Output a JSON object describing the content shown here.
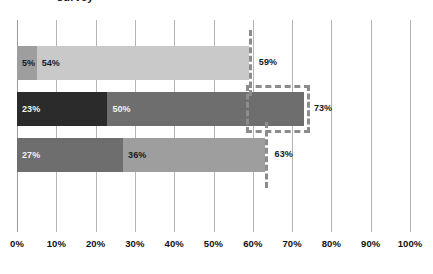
{
  "title_fragment": "survey",
  "chart_data": {
    "type": "bar",
    "orientation": "horizontal",
    "stacked": true,
    "title": "",
    "xlabel": "",
    "ylabel": "",
    "xlim": [
      0,
      100
    ],
    "xticks": [
      "0%",
      "10%",
      "20%",
      "30%",
      "40%",
      "50%",
      "60%",
      "70%",
      "80%",
      "90%",
      "100%"
    ],
    "xtick_values": [
      0,
      10,
      20,
      30,
      40,
      50,
      60,
      70,
      80,
      90,
      100
    ],
    "grid": true,
    "legend": "none",
    "categories": [
      "bar-1",
      "bar-2",
      "bar-3"
    ],
    "series": [
      {
        "name": "segment-1",
        "values": [
          5,
          23,
          27
        ]
      },
      {
        "name": "segment-2",
        "values": [
          54,
          50,
          36
        ]
      }
    ],
    "bars": [
      {
        "id": "bar-1",
        "segments": [
          {
            "label": "5%",
            "value": 5,
            "color": "#9e9e9e",
            "text_color": "#1a1a1a"
          },
          {
            "label": "54%",
            "value": 54,
            "color": "#c9c9c9",
            "text_color": "#1a1a1a"
          }
        ],
        "total_label": "59%",
        "total_value": 59,
        "marker": {
          "type": "line",
          "value": 59,
          "color": "#8c8c8c",
          "style": "dashed"
        }
      },
      {
        "id": "bar-2",
        "segments": [
          {
            "label": "23%",
            "value": 23,
            "color": "#2b2b2b",
            "text_color": "#f2f2f2"
          },
          {
            "label": "50%",
            "value": 50,
            "color": "#6e6e6e",
            "text_color": "#f2f2f2"
          }
        ],
        "total_label": "73%",
        "total_value": 73,
        "marker": {
          "type": "box",
          "value": 73,
          "color": "#8c8c8c",
          "style": "dashed"
        }
      },
      {
        "id": "bar-3",
        "segments": [
          {
            "label": "27%",
            "value": 27,
            "color": "#6e6e6e",
            "text_color": "#f2f2f2"
          },
          {
            "label": "36%",
            "value": 36,
            "color": "#9e9e9e",
            "text_color": "#1a1a1a"
          }
        ],
        "total_label": "63%",
        "total_value": 63,
        "marker": {
          "type": "line",
          "value": 63,
          "color": "#8c8c8c",
          "style": "dashed"
        }
      }
    ],
    "colors": {
      "gridline": "#b4b4b4",
      "background": "#ffffff",
      "axis_text": "#111111",
      "marker": "#8c8c8c"
    }
  }
}
